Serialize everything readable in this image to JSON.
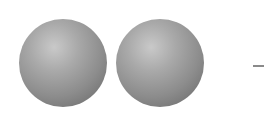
{
  "diagram": {
    "spheres": [
      {
        "name": "sphere-left",
        "cx": 63,
        "cy": 63,
        "r": 44,
        "color": "#8c8c8c"
      },
      {
        "name": "sphere-right",
        "cx": 160,
        "cy": 63,
        "r": 44,
        "color": "#8c8c8c"
      }
    ],
    "line": {
      "x1": 253,
      "x2": 264,
      "y": 66,
      "color": "#8a8a8a"
    },
    "background": "#ffffff"
  }
}
